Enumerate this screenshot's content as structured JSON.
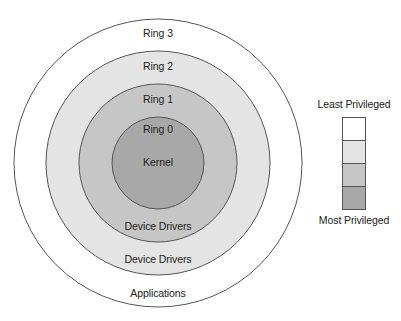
{
  "diagram": {
    "title_cutoff": "",
    "center": {
      "x": 158,
      "y": 163
    },
    "rings": [
      {
        "name": "Ring 3",
        "radius": 144,
        "fill": "#ffffff",
        "label": "Ring 3",
        "bottom_label": "Applications"
      },
      {
        "name": "Ring 2",
        "radius": 112,
        "fill": "#e4e4e4",
        "label": "Ring 2",
        "bottom_label": "Device Drivers"
      },
      {
        "name": "Ring 1",
        "radius": 79,
        "fill": "#c6c6c6",
        "label": "Ring 1",
        "bottom_label": "Device Drivers"
      },
      {
        "name": "Ring 0",
        "radius": 46,
        "fill": "#a8a8a8",
        "label": "Ring 0",
        "bottom_label": ""
      }
    ],
    "kernel_label": "Kernel",
    "stroke": "#555555"
  },
  "legend": {
    "top_label": "Least Privileged",
    "bottom_label": "Most Privileged",
    "swatches": [
      "#ffffff",
      "#e4e4e4",
      "#c6c6c6",
      "#a8a8a8"
    ]
  }
}
